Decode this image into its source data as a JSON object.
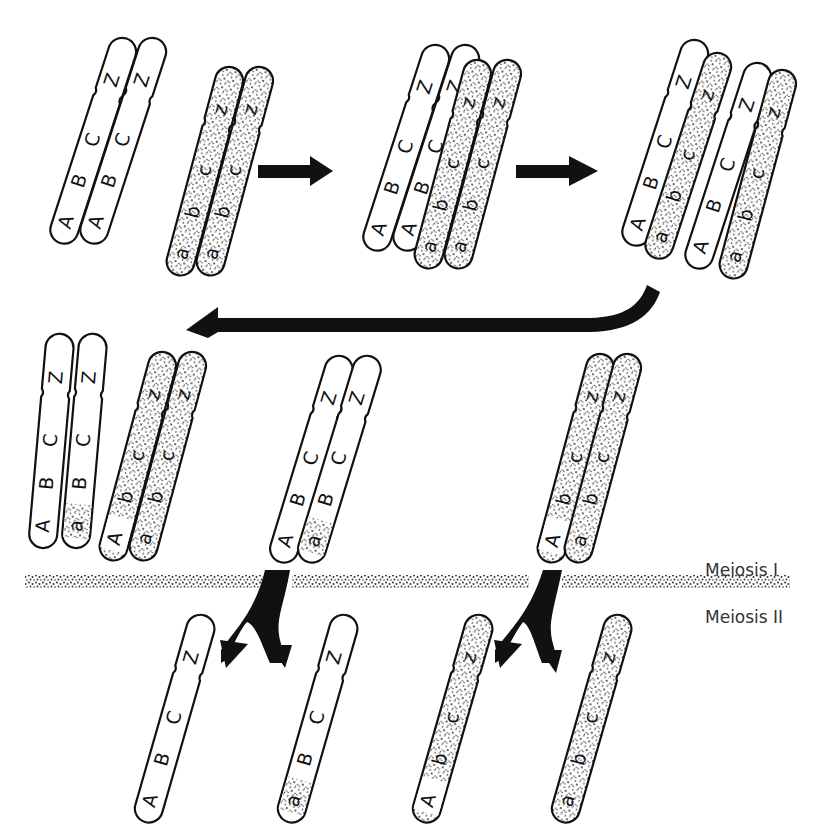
{
  "colors": {
    "ink": "#111111",
    "paper": "#ffffff",
    "stipple": "#222222"
  },
  "labels": {
    "meiosis_i": "Meiosis I",
    "meiosis_ii": "Meiosis II"
  },
  "stages": [
    {
      "id": "stage-1-separate-homologs",
      "description": "Two replicated homologous chromosomes, unpaired",
      "chromosomes": [
        {
          "name": "paternal-homolog",
          "shading": "clear",
          "chromatids": [
            [
              "A",
              "B",
              "C",
              "Z"
            ],
            [
              "A",
              "B",
              "C",
              "Z"
            ]
          ]
        },
        {
          "name": "maternal-homolog",
          "shading": "stippled",
          "chromatids": [
            [
              "a",
              "b",
              "c",
              "z"
            ],
            [
              "a",
              "b",
              "c",
              "z"
            ]
          ]
        }
      ]
    },
    {
      "id": "stage-2-synapsis",
      "description": "Homologs paired (synapsis)",
      "chromosomes": [
        {
          "name": "paternal-homolog",
          "shading": "clear",
          "chromatids": [
            [
              "A",
              "B",
              "C",
              "Z"
            ],
            [
              "A",
              "B",
              "C",
              "Z"
            ]
          ]
        },
        {
          "name": "maternal-homolog",
          "shading": "stippled",
          "chromatids": [
            [
              "a",
              "b",
              "c",
              "z"
            ],
            [
              "a",
              "b",
              "c",
              "z"
            ]
          ]
        }
      ]
    },
    {
      "id": "stage-3-crossing-over",
      "description": "Non-sister chromatids cross over (chiasma)",
      "chromosomes": [
        {
          "name": "paternal-homolog",
          "shading": "clear",
          "chromatids": [
            [
              "A",
              "B",
              "C",
              "Z"
            ],
            [
              "A",
              "B",
              "C",
              "Z"
            ]
          ]
        },
        {
          "name": "maternal-homolog",
          "shading": "stippled",
          "chromatids": [
            [
              "a",
              "b",
              "c",
              "z"
            ],
            [
              "a",
              "b",
              "c",
              "z"
            ]
          ]
        }
      ]
    },
    {
      "id": "stage-4-recombined-tetrad",
      "description": "Recombined chromatids after exchange",
      "chromosomes": [
        {
          "name": "paternal-homolog",
          "shading": "clear",
          "chromatids": [
            [
              "A",
              "B",
              "C",
              "Z"
            ],
            [
              "a",
              "B",
              "C",
              "Z"
            ]
          ]
        },
        {
          "name": "maternal-homolog",
          "shading": "stippled",
          "chromatids": [
            [
              "A",
              "b",
              "c",
              "z"
            ],
            [
              "a",
              "b",
              "c",
              "z"
            ]
          ]
        }
      ]
    },
    {
      "id": "stage-5-meiosis-i-products",
      "description": "Homologs separated after Meiosis I",
      "chromosomes": [
        {
          "name": "paternal-dyad",
          "shading": "clear",
          "chromatids": [
            [
              "A",
              "B",
              "C",
              "Z"
            ],
            [
              "a",
              "B",
              "C",
              "Z"
            ]
          ]
        },
        {
          "name": "maternal-dyad",
          "shading": "stippled",
          "chromatids": [
            [
              "A",
              "b",
              "c",
              "z"
            ],
            [
              "a",
              "b",
              "c",
              "z"
            ]
          ]
        }
      ]
    },
    {
      "id": "stage-6-meiosis-ii-products",
      "description": "Four haploid chromatids after Meiosis II",
      "chromosomes": [
        {
          "name": "gamete-1",
          "shading": "clear",
          "chromatids": [
            [
              "A",
              "B",
              "C",
              "Z"
            ]
          ]
        },
        {
          "name": "gamete-2-recombinant",
          "shading": "clear",
          "chromatids": [
            [
              "a",
              "B",
              "C",
              "Z"
            ]
          ]
        },
        {
          "name": "gamete-3-recombinant",
          "shading": "stippled",
          "chromatids": [
            [
              "A",
              "b",
              "c",
              "z"
            ]
          ]
        },
        {
          "name": "gamete-4",
          "shading": "stippled",
          "chromatids": [
            [
              "a",
              "b",
              "c",
              "z"
            ]
          ]
        }
      ]
    }
  ]
}
